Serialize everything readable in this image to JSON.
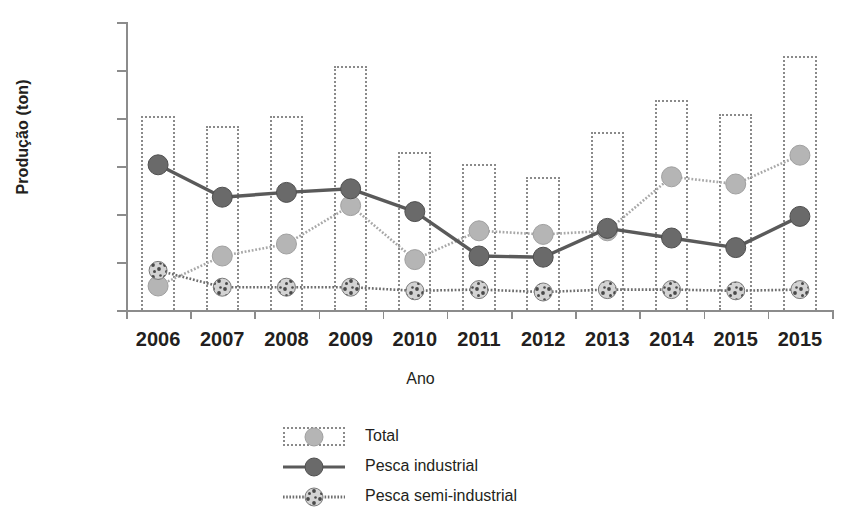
{
  "chart_data": {
    "type": "bar",
    "title": "",
    "xlabel": "Ano",
    "ylabel": "Produção (ton)",
    "categories": [
      "2006",
      "2007",
      "2008",
      "2009",
      "2010",
      "2011",
      "2012",
      "2013",
      "2014",
      "2015",
      "2015"
    ],
    "ylim": [
      0,
      12000
    ],
    "ytick_labels": [
      "0",
      "2000",
      "4000",
      "6000",
      "8000",
      "10000",
      "12000"
    ],
    "ytick_values": [
      0,
      2000,
      4000,
      6000,
      8000,
      10000,
      12000
    ],
    "grid": false,
    "legend_position": "bottom-center",
    "series": [
      {
        "name": "Total",
        "render": "bar",
        "marker": "light-circle",
        "color": "#8a8a8a",
        "values": [
          8100,
          7650,
          8100,
          10150,
          6600,
          6100,
          5550,
          7400,
          8750,
          8150,
          10600
        ]
      },
      {
        "name": "Pesca industrial",
        "render": "line-solid",
        "marker": "dark-circle",
        "color": "#5a5a5a",
        "values": [
          6050,
          4700,
          4900,
          5050,
          4100,
          2250,
          2200,
          3400,
          3000,
          2600,
          3900
        ]
      },
      {
        "name": "Pesca semi-industrial",
        "render": "line-dotted",
        "marker": "speckled-circle",
        "color": "#6e6e6e",
        "values": [
          1650,
          950,
          950,
          950,
          800,
          850,
          750,
          850,
          850,
          800,
          850
        ]
      },
      {
        "name": "Pesca artesanal",
        "render": "line-dotted",
        "marker": "light-circle",
        "color": "#a8a8a8",
        "values": [
          1000,
          2250,
          2750,
          4350,
          2100,
          3300,
          3150,
          3300,
          5550,
          5250,
          6450
        ]
      }
    ]
  },
  "legend": {
    "items": [
      {
        "label": "Total",
        "key": "dotted-box-with-light-circle"
      },
      {
        "label": "Pesca industrial",
        "key": "solid-line-with-dark-circle"
      },
      {
        "label": "Pesca semi-industrial",
        "key": "dotted-line-with-speckled-circle"
      }
    ]
  }
}
